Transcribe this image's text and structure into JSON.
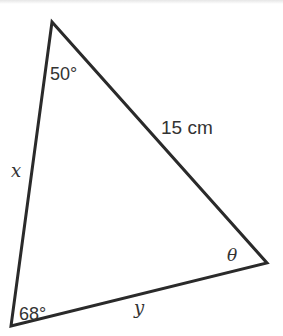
{
  "diagram": {
    "type": "triangle",
    "stroke_color": "#2a2a2a",
    "text_color": "#333333",
    "vertices": {
      "top": [
        52,
        22
      ],
      "bottom_left": [
        11,
        326
      ],
      "right": [
        267,
        263
      ]
    },
    "angles": {
      "top": "50°",
      "bottom_left": "68°",
      "right": "θ"
    },
    "sides": {
      "top_to_right": "15 cm",
      "top_to_bottom_left": "x",
      "bottom_left_to_right": "y"
    }
  }
}
